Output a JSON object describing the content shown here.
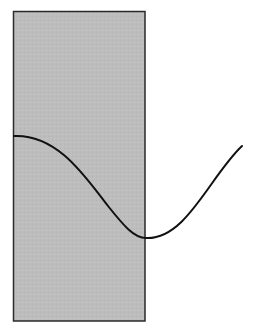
{
  "diagram": {
    "rect": {
      "x": 13.5,
      "y": 11.5,
      "width": 131.5,
      "height": 309.5,
      "fill": "#bdbdbd",
      "stroke": "#2a2a2a"
    },
    "wave": {
      "stroke": "#111111",
      "stroke_width": 2,
      "path": "M14,136 C58,134 86,178 108,206 C124,226 134,238 146,238 C186,240 210,176 242,146"
    }
  }
}
